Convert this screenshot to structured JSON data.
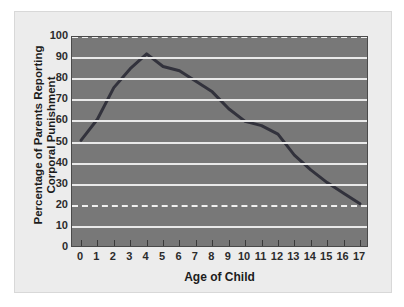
{
  "chart_data": {
    "type": "line",
    "title": "",
    "xlabel": "Age of Child",
    "ylabel_line1": "Percentage of Parents Reporting",
    "ylabel_line2": "Corporal Punishment",
    "x": [
      0,
      1,
      2,
      3,
      4,
      5,
      6,
      7,
      8,
      9,
      10,
      11,
      12,
      13,
      14,
      15,
      16,
      17
    ],
    "values": [
      51,
      61,
      76,
      85,
      92,
      86,
      84,
      79,
      74,
      66,
      60,
      58,
      54,
      44,
      37,
      31,
      26,
      21
    ],
    "series": [
      {
        "name": "Percentage of Parents Reporting Corporal Punishment",
        "values": [
          51,
          61,
          76,
          85,
          92,
          86,
          84,
          79,
          74,
          66,
          60,
          58,
          54,
          44,
          37,
          31,
          26,
          21
        ]
      }
    ],
    "xlim": [
      0,
      17
    ],
    "ylim": [
      0,
      100
    ],
    "xticks": [
      "0",
      "1",
      "2",
      "3",
      "4",
      "5",
      "6",
      "7",
      "8",
      "9",
      "10",
      "11",
      "12",
      "13",
      "14",
      "15",
      "16",
      "17"
    ],
    "yticks": [
      "0",
      "10",
      "20",
      "30",
      "40",
      "50",
      "60",
      "70",
      "80",
      "90",
      "100"
    ],
    "ytick_values": [
      0,
      10,
      20,
      30,
      40,
      50,
      60,
      70,
      80,
      90,
      100
    ],
    "grid": true,
    "gridlines_solid": [
      10,
      30,
      40,
      50,
      60,
      70,
      80,
      90
    ],
    "gridlines_dashed": [
      20,
      100
    ],
    "legend": "none",
    "colors": {
      "plot_background": "#787878",
      "page_background": "#ececec",
      "gridline": "#e9e9e9",
      "dashed_gridline": "#f0f0f0",
      "line": "#32323c",
      "axis_text": "#1c1c1c",
      "frame": "#4a4a4a"
    }
  }
}
